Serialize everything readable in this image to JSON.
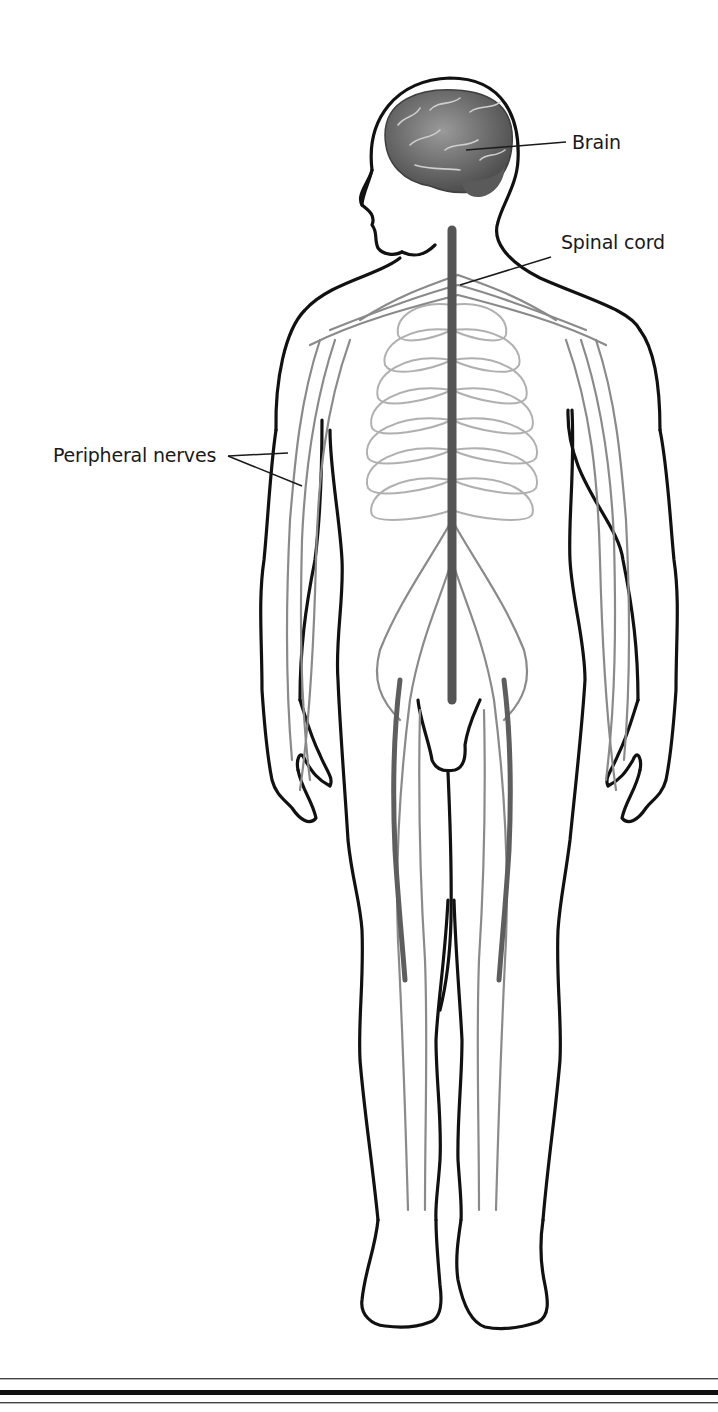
{
  "diagram": {
    "labels": [
      {
        "id": "brain",
        "text": "Brain"
      },
      {
        "id": "spinal_cord",
        "text": "Spinal cord"
      },
      {
        "id": "peripheral_nerves",
        "text": "Peripheral nerves"
      }
    ],
    "colors": {
      "outline": "#111111",
      "brain": "#6b6b6b",
      "spinal_cord": "#555555",
      "nerves": "#8a8a8a",
      "ribs": "#b0b0b0",
      "background": "#ffffff"
    }
  }
}
